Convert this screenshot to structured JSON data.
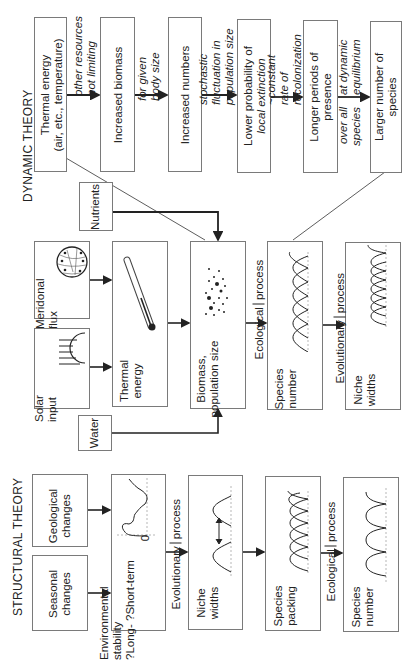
{
  "titles": {
    "dynamic": "DYNAMIC THEORY",
    "structural": "STRUCTURAL THEORY"
  },
  "top_chain": {
    "boxes": [
      {
        "line1": "Thermal energy",
        "line2": "(air, etc., temperature)"
      },
      {
        "line1": "Increased biomass",
        "line2": ""
      },
      {
        "line1": "Increased numbers",
        "line2": ""
      },
      {
        "line1": "Lower probability of",
        "line2": "local extinction"
      },
      {
        "line1": "Longer periods of",
        "line2": "presence"
      },
      {
        "line1": "Larger number of",
        "line2": "species"
      }
    ],
    "arrow_labels": [
      {
        "above1": "other resources",
        "above2": "not limiting",
        "below1": "",
        "below2": ""
      },
      {
        "above1": "for given",
        "above2": "body size",
        "below1": "",
        "below2": ""
      },
      {
        "above1": "stochastic",
        "above2": "fluctuation in",
        "above3": "population size",
        "below1": "",
        "below2": ""
      },
      {
        "above1": "~constant",
        "above2": "rate of",
        "above3": "recolonization",
        "below1": "",
        "below2": ""
      },
      {
        "above1": "at dynamic",
        "above2": "equilibrium",
        "below1": "over all",
        "below2": "species"
      }
    ]
  },
  "dynamic": {
    "nutrients": "Nutrients",
    "meridional": {
      "line1": "Meridonal",
      "line2": "flux"
    },
    "solar": {
      "line1": "Solar",
      "line2": "input"
    },
    "thermal": {
      "line1": "Thermal",
      "line2": "energy"
    },
    "biomass": {
      "line1": "Biomass,",
      "line2": "population size"
    },
    "species_number": {
      "line1": "Species",
      "line2": "number"
    },
    "niche_widths": {
      "line1": "Niche",
      "line2": "widths"
    },
    "water": "Water",
    "ecological_process": {
      "a": "Ecological",
      "b": "process"
    },
    "evolutionary_process": {
      "a": "Evolutionary",
      "b": "process"
    }
  },
  "structural": {
    "seasonal": {
      "line1": "Seasonal",
      "line2": "changes"
    },
    "geological": {
      "line1": "Geological",
      "line2": "changes"
    },
    "env_stability": {
      "line1": "Environmental",
      "line2": "stability",
      "line3": "?Long- ?Short-term",
      "zero": "0"
    },
    "niche_widths": {
      "line1": "Niche",
      "line2": "widths"
    },
    "species_packing": {
      "line1": "Species",
      "line2": "packing"
    },
    "species_number": {
      "line1": "Species",
      "line2": "number"
    },
    "evolutionary_process": {
      "a": "Evolutionary",
      "b": "process"
    },
    "ecological_process": {
      "a": "Ecological",
      "b": "process"
    }
  },
  "colors": {
    "line": "#222222",
    "border": "#7a7a7a",
    "dashed": "#888888"
  }
}
